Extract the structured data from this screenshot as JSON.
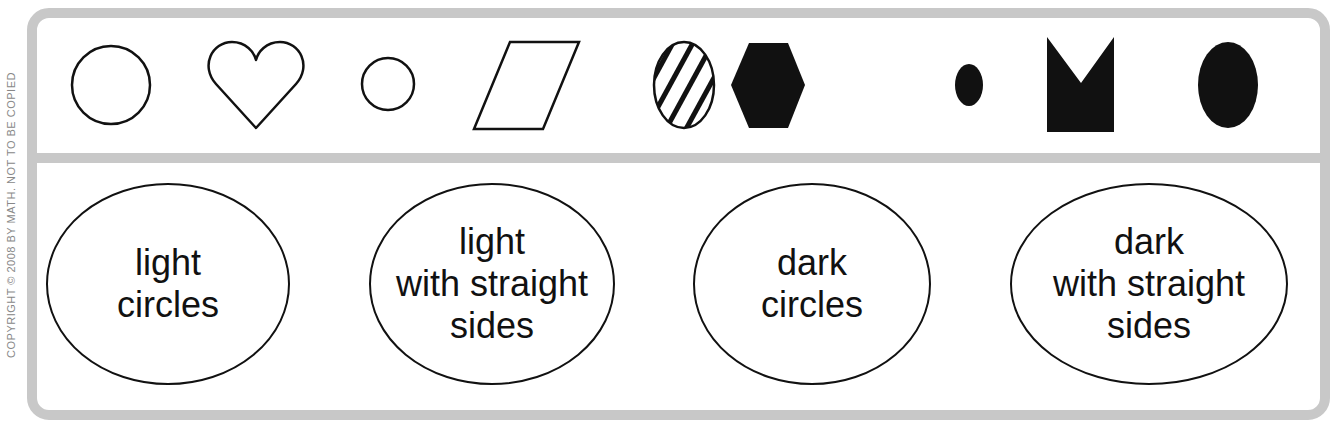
{
  "copyright": "COPYRIGHT © 2008 BY MATH. NOT TO BE COPIED",
  "colors": {
    "frame": "#c8c8c8",
    "ink": "#111111",
    "background": "#ffffff"
  },
  "shapes": [
    {
      "name": "large-light-circle",
      "kind": "circle",
      "fill": "light"
    },
    {
      "name": "light-heart",
      "kind": "heart",
      "fill": "light"
    },
    {
      "name": "small-light-circle",
      "kind": "circle",
      "fill": "light"
    },
    {
      "name": "light-parallelogram",
      "kind": "parallelogram",
      "fill": "light"
    },
    {
      "name": "striped-circle",
      "kind": "circle",
      "fill": "striped"
    },
    {
      "name": "dark-hexagon",
      "kind": "hexagon",
      "fill": "dark"
    },
    {
      "name": "small-dark-circle",
      "kind": "circle",
      "fill": "dark"
    },
    {
      "name": "dark-notched-square",
      "kind": "notched-square",
      "fill": "dark"
    },
    {
      "name": "large-dark-circle",
      "kind": "circle",
      "fill": "dark"
    }
  ],
  "groups": [
    {
      "lines": [
        "light",
        "circles"
      ]
    },
    {
      "lines": [
        "light",
        "with straight",
        "sides"
      ]
    },
    {
      "lines": [
        "dark",
        "circles"
      ]
    },
    {
      "lines": [
        "dark",
        "with straight",
        "sides"
      ]
    }
  ]
}
